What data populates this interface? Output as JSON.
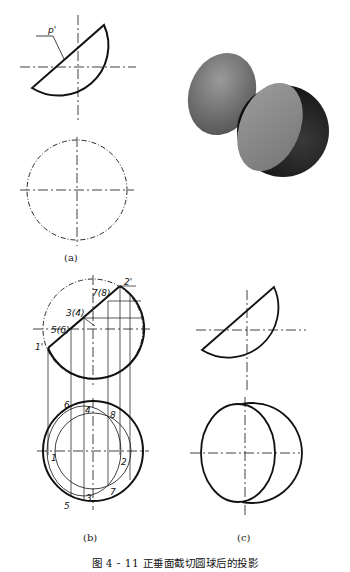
{
  "figure": {
    "caption": "图 4 - 11   正垂面截切圆球后的投影",
    "panels": [
      {
        "id": "a",
        "label": "(a)",
        "annotations": [
          "p'"
        ]
      },
      {
        "id": "b",
        "label": "(b)",
        "annotations": [
          "1'",
          "2'",
          "3(4)",
          "5(6)",
          "7(8)",
          "1",
          "2",
          "3",
          "4",
          "5",
          "6",
          "7",
          "8"
        ]
      },
      {
        "id": "c",
        "label": "(c)",
        "annotations": []
      }
    ],
    "render_3d": {
      "description": "sphere cut by inclined plane, two pieces",
      "colors": {
        "light": "#8a8a8a",
        "dark": "#1e1e1e"
      }
    }
  },
  "labels": {
    "a": "(a)",
    "b": "(b)",
    "c": "(c)",
    "p_prime": "p'",
    "pt1p": "1'",
    "pt2p": "2'",
    "pt34p": "3(4)",
    "pt56p": "5(6)",
    "pt78p": "7(8)",
    "pt1": "1",
    "pt2": "2",
    "pt3": "3",
    "pt4": "4",
    "pt5": "5",
    "pt6": "6",
    "pt7": "7",
    "pt8": "8"
  }
}
